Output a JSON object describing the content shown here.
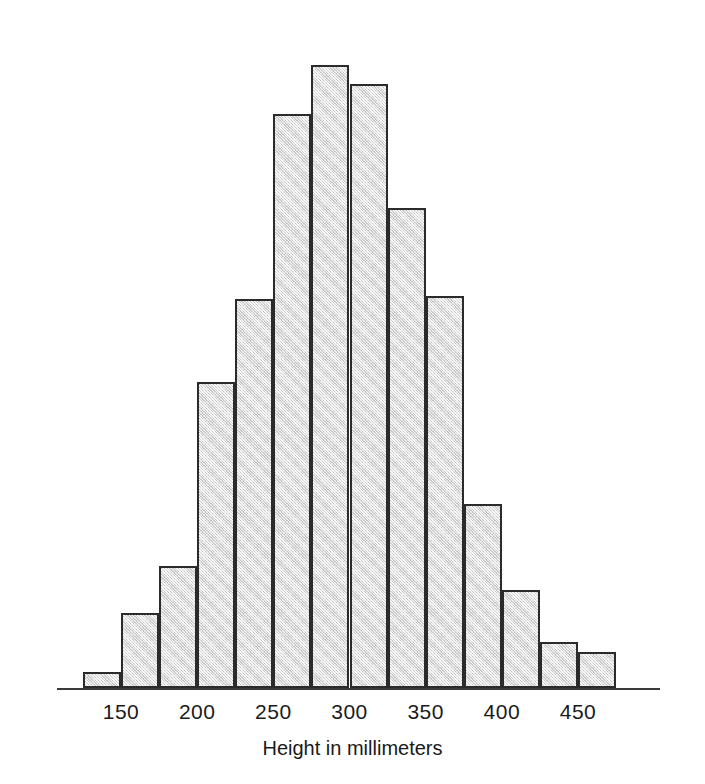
{
  "figure": {
    "background_color": "#ffffff",
    "bar_fill_color": "#d9d9d9",
    "bar_edge_color": "#2b2b2b",
    "axis_color": "#3a3a3a",
    "text_color": "#1a1a1a"
  },
  "chart_data": {
    "type": "bar",
    "chart_subtype": "histogram",
    "title": "",
    "xlabel": "Height in millimeters",
    "ylabel": "",
    "grid": false,
    "legend": null,
    "xlim": [
      112,
      488
    ],
    "ylim": [
      0,
      640
    ],
    "bin_width": 25,
    "x_tick_labels": [
      "150",
      "200",
      "250",
      "300",
      "350",
      "400",
      "450"
    ],
    "x_tick_values": [
      150,
      200,
      250,
      300,
      350,
      400,
      450
    ],
    "categories": [
      "125-150",
      "150-175",
      "175-200",
      "200-225",
      "225-250",
      "250-275",
      "275-300",
      "300-325",
      "325-350",
      "350-375",
      "375-400",
      "400-425",
      "425-450",
      "450-475"
    ],
    "bin_edges": [
      125,
      150,
      175,
      200,
      225,
      250,
      275,
      300,
      325,
      350,
      375,
      400,
      425,
      450,
      475
    ],
    "values": [
      16,
      75,
      122,
      306,
      389,
      574,
      623,
      604,
      480,
      392,
      184,
      98,
      46,
      36
    ]
  }
}
